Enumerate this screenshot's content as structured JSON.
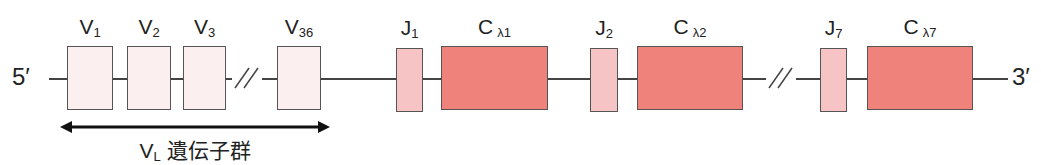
{
  "diagram": {
    "five_prime": "5′",
    "three_prime": "3′",
    "v_segments": [
      {
        "main": "V",
        "sub": "1",
        "x": 67,
        "w": 46
      },
      {
        "main": "V",
        "sub": "2",
        "x": 127,
        "w": 44
      },
      {
        "main": "V",
        "sub": "3",
        "x": 183,
        "w": 43
      },
      {
        "main": "V",
        "sub": "36",
        "x": 277,
        "w": 44
      }
    ],
    "j_segments": [
      {
        "main": "J",
        "sub": "1",
        "x": 396,
        "w": 27
      },
      {
        "main": "J",
        "sub": "2",
        "x": 590,
        "w": 28
      },
      {
        "main": "J",
        "sub": "7",
        "x": 820,
        "w": 27
      }
    ],
    "c_segments": [
      {
        "main": "C",
        "sub": "λ1",
        "x": 441,
        "w": 107
      },
      {
        "main": "C",
        "sub": "λ2",
        "x": 637,
        "w": 106
      },
      {
        "main": "C",
        "sub": "λ7",
        "x": 867,
        "w": 106
      }
    ],
    "vl_group": {
      "main": "V",
      "sub": "L",
      "text": " 遺伝子群"
    },
    "colors": {
      "v_fill": "#FCEFEF",
      "j_fill": "#F6C4C4",
      "c_fill": "#F0827C",
      "outline": "#555555"
    }
  }
}
